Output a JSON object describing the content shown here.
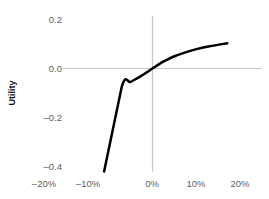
{
  "chart_data": {
    "type": "line",
    "title": "",
    "subtitle": "",
    "xlabel": "",
    "ylabel": "Utility",
    "xlim": [
      -20,
      20
    ],
    "ylim": [
      -0.4,
      0.2
    ],
    "grid": false,
    "legend": null,
    "legend_position": "none",
    "x_tick_labels": [
      "–20%",
      "–10%",
      "0%",
      "10%",
      "20%"
    ],
    "x_tick_values": [
      -20,
      -10,
      0,
      10,
      20
    ],
    "y_tick_labels": [
      "0.2",
      "0.0",
      "–0.2",
      "–0.4"
    ],
    "y_tick_values": [
      0.2,
      0.0,
      -0.2,
      -0.4
    ],
    "axis_lines": {
      "x_zero_line": 0,
      "y_zero_line": 0,
      "color": "#c8c8c8"
    },
    "series": [
      {
        "name": "Utility",
        "color": "#000000",
        "line_width": 2.5,
        "x": [
          -11.0,
          -7.0,
          -5.0,
          -3.0,
          -1.5,
          0.0,
          1.5,
          3.0,
          5.0,
          7.5,
          10.0,
          13.0,
          17.0
        ],
        "y": [
          -0.42,
          -0.075,
          -0.055,
          -0.035,
          -0.018,
          0.0,
          0.018,
          0.033,
          0.05,
          0.066,
          0.079,
          0.091,
          0.103
        ]
      }
    ],
    "annotations": [
      {
        "text": "kink at reference point",
        "x": -7.0,
        "y": -0.075,
        "visible": false
      }
    ]
  },
  "yticks": [
    {
      "label": "0.2",
      "top": 14
    },
    {
      "label": "0.0",
      "top": 63
    },
    {
      "label": "–0.2",
      "top": 112
    },
    {
      "label": "–0.4",
      "top": 161
    }
  ],
  "xticks": [
    {
      "label": "–20%",
      "left": 19
    },
    {
      "label": "–10%",
      "left": 63
    },
    {
      "label": "0%",
      "left": 127
    },
    {
      "label": "10%",
      "left": 171
    },
    {
      "label": "20%",
      "left": 215
    }
  ],
  "axis": {
    "y_title": "Utility"
  }
}
